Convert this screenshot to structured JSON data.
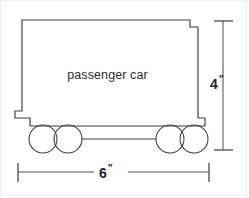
{
  "diagram": {
    "body_label": "passenger car",
    "stroke_color": "#3c3c42",
    "dimension_color": "#55555c",
    "background_color": "#ffffff"
  },
  "dimensions": {
    "height": {
      "value": "4",
      "unit": "”",
      "orientation": "vertical",
      "position": "right"
    },
    "width": {
      "value": "6",
      "unit": "”",
      "orientation": "horizontal",
      "position": "bottom"
    }
  },
  "shapes": {
    "car_body": {
      "name": "notched-rectangle",
      "points": "22,20 190,20 190,26 198,26 198,118 205,118 205,126 30,126 30,118 15,118 15,110 22,110"
    },
    "wheels": [
      {
        "name": "wheel-front-left",
        "cx": 43,
        "cy": 139,
        "r": 14
      },
      {
        "name": "wheel-front-right",
        "cx": 68,
        "cy": 139,
        "r": 14
      },
      {
        "name": "wheel-rear-left",
        "cx": 170,
        "cy": 139,
        "r": 14
      },
      {
        "name": "wheel-rear-right",
        "cx": 194,
        "cy": 139,
        "r": 14
      }
    ],
    "axle": {
      "x1": 82,
      "y1": 139,
      "x2": 156,
      "y2": 139
    }
  }
}
